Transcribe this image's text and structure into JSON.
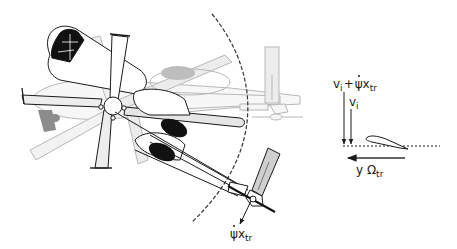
{
  "diagram": {
    "type": "helicopter-yaw-tail-rotor-kinematics",
    "colors": {
      "line": "#1a1a1a",
      "ghost_line": "#b8b8b8",
      "blade_fill": "#e6e6e6",
      "ghost_fill": "#ececec",
      "dark_fill": "#111111",
      "gray_fill": "#8c8c8c",
      "dashed_arc": "#333333"
    },
    "labels": {
      "tail_velocity": {
        "symbol": "ψ",
        "base": "x",
        "sub": "tr"
      },
      "total_inflow": {
        "v": "v",
        "v_sub": "i",
        "plus": "+",
        "psi": "ψ",
        "x": "x",
        "x_sub": "tr"
      },
      "induced_inflow": {
        "v": "v",
        "sub": "i"
      },
      "rotational_velocity": {
        "y": "y",
        "omega": "Ω",
        "sub": "tr"
      }
    }
  }
}
